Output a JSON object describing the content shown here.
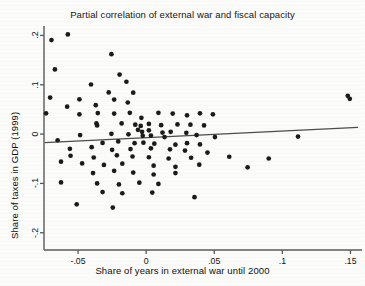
{
  "chart_data": {
    "type": "scatter",
    "title": "Partial correlation of external war and fiscal capacity",
    "xlabel": "Share of years in external war until 2000",
    "ylabel": "Share of taxes in GDP (1999)",
    "xlim": [
      -0.075,
      0.157
    ],
    "ylim": [
      -0.235,
      0.215
    ],
    "grid": false,
    "legend": null,
    "xticks": [
      -0.05,
      0,
      0.05,
      0.1,
      0.15
    ],
    "xtick_labels": [
      "-.05",
      "0",
      ".05",
      ".1",
      ".15"
    ],
    "yticks": [
      0.2,
      0.1,
      0,
      -0.1,
      -0.2
    ],
    "ytick_labels": [
      ".2",
      ".1",
      "0",
      "-.1",
      "-.2"
    ],
    "marker": {
      "shape": "circle",
      "color": "#1a1a1a",
      "size_px": 4.4
    },
    "fit_line": {
      "name": "linear fit",
      "color": "#4b4b4b",
      "x_start": -0.0745,
      "y_start": -0.0175,
      "x_end": 0.1555,
      "y_end": 0.0135
    },
    "points": [
      [
        -0.0695,
        0.1905
      ],
      [
        -0.0575,
        0.202
      ],
      [
        -0.067,
        0.131
      ],
      [
        -0.0255,
        0.162
      ],
      [
        -0.0195,
        0.1205
      ],
      [
        -0.0145,
        0.106
      ],
      [
        -0.0405,
        0.1005
      ],
      [
        -0.0275,
        0.0845
      ],
      [
        -0.0705,
        0.074
      ],
      [
        -0.049,
        0.0705
      ],
      [
        -0.058,
        0.0555
      ],
      [
        -0.037,
        0.0585
      ],
      [
        -0.0235,
        0.07
      ],
      [
        -0.0135,
        0.064
      ],
      [
        -0.0095,
        0.084
      ],
      [
        -0.0735,
        0.042
      ],
      [
        -0.049,
        0.04
      ],
      [
        -0.0355,
        0.0425
      ],
      [
        -0.0235,
        0.0415
      ],
      [
        -0.012,
        0.043
      ],
      [
        -0.0035,
        0.033
      ],
      [
        0.009,
        0.043
      ],
      [
        0.0195,
        0.0415
      ],
      [
        0.03,
        0.038
      ],
      [
        0.0395,
        0.042
      ],
      [
        0.049,
        0.04
      ],
      [
        0.148,
        0.0775
      ],
      [
        0.1495,
        0.0715
      ],
      [
        -0.0365,
        0.0215
      ],
      [
        -0.036,
        0.0175
      ],
      [
        -0.018,
        0.0215
      ],
      [
        -0.008,
        0.019
      ],
      [
        -0.004,
        0.0165
      ],
      [
        0.002,
        0.0205
      ],
      [
        0.011,
        0.018
      ],
      [
        0.023,
        0.0195
      ],
      [
        0.0325,
        0.019
      ],
      [
        0.0425,
        0.0175
      ],
      [
        -0.006,
        0.0085
      ],
      [
        -0.003,
        0.0045
      ],
      [
        0.002,
        0.0075
      ],
      [
        0.018,
        0.0045
      ],
      [
        0.0295,
        0.0025
      ],
      [
        0.012,
        0.003
      ],
      [
        -0.0485,
        -0.002
      ],
      [
        -0.0255,
        0.0005
      ],
      [
        -0.013,
        -0.0005
      ],
      [
        -0.0025,
        -0.0035
      ],
      [
        0.0035,
        -0.003
      ],
      [
        0.0135,
        -0.006
      ],
      [
        0.037,
        -0.002
      ],
      [
        0.0505,
        -0.006
      ],
      [
        0.1115,
        -0.005
      ],
      [
        -0.065,
        -0.0125
      ],
      [
        -0.032,
        -0.018
      ],
      [
        -0.0205,
        -0.015
      ],
      [
        -0.0085,
        -0.0185
      ],
      [
        -0.002,
        -0.0175
      ],
      [
        0.006,
        -0.0195
      ],
      [
        0.0215,
        -0.0215
      ],
      [
        0.03,
        -0.0185
      ],
      [
        0.0395,
        -0.021
      ],
      [
        -0.056,
        -0.03
      ],
      [
        -0.04,
        -0.0265
      ],
      [
        -0.025,
        -0.032
      ],
      [
        -0.0115,
        -0.0305
      ],
      [
        0.0035,
        -0.029
      ],
      [
        0.0175,
        -0.031
      ],
      [
        0.0285,
        -0.0335
      ],
      [
        0.045,
        -0.0375
      ],
      [
        -0.0555,
        -0.044
      ],
      [
        -0.0385,
        -0.0475
      ],
      [
        -0.0215,
        -0.043
      ],
      [
        -0.01,
        -0.0455
      ],
      [
        0.002,
        -0.047
      ],
      [
        0.0165,
        -0.0495
      ],
      [
        0.033,
        -0.048
      ],
      [
        0.061,
        -0.046
      ],
      [
        0.09,
        -0.0495
      ],
      [
        -0.0625,
        -0.056
      ],
      [
        -0.047,
        -0.0595
      ],
      [
        -0.031,
        -0.0625
      ],
      [
        -0.0175,
        -0.06
      ],
      [
        0.0055,
        -0.064
      ],
      [
        0.0215,
        -0.0665
      ],
      [
        0.039,
        -0.062
      ],
      [
        0.0745,
        -0.0675
      ],
      [
        -0.039,
        -0.079
      ],
      [
        -0.0235,
        -0.0745
      ],
      [
        -0.0095,
        -0.078
      ],
      [
        0.0055,
        -0.082
      ],
      [
        0.0215,
        -0.079
      ],
      [
        -0.0625,
        -0.098
      ],
      [
        -0.036,
        -0.1
      ],
      [
        -0.02,
        -0.102
      ],
      [
        -0.005,
        -0.0985
      ],
      [
        0.009,
        -0.101
      ],
      [
        -0.032,
        -0.1175
      ],
      [
        -0.0175,
        -0.12
      ],
      [
        0.0045,
        -0.1185
      ],
      [
        0.0355,
        -0.128
      ],
      [
        -0.051,
        -0.1425
      ],
      [
        -0.0245,
        -0.149
      ]
    ]
  }
}
